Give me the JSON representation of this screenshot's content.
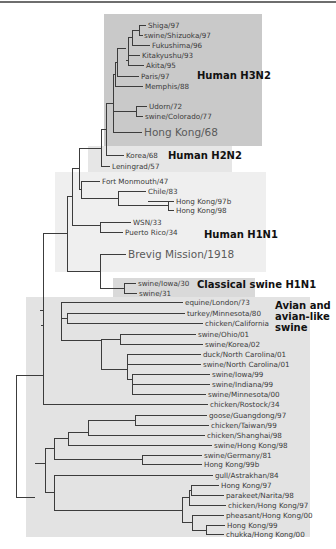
{
  "figure": {
    "type": "phylogenetic-tree",
    "colors": {
      "h3n2_box": "#c9c9c9",
      "h2n2_box": "#e6e6e6",
      "h1n1_box": "#efefef",
      "classical_swine_box": "#d9d9d9",
      "avian_box": "#e3e3e3",
      "line": "#3c3c3c"
    },
    "clades": [
      {
        "id": "h3n2",
        "label": "Human H3N2",
        "box": [
          104,
          14,
          158,
          132
        ],
        "fill": "#c9c9c9",
        "lines": [
          "Human H3N2"
        ],
        "label_xy": [
          197,
          79
        ]
      },
      {
        "id": "h2n2",
        "label": "Human H2N2",
        "box": [
          88,
          146,
          144,
          26
        ],
        "fill": "#e6e6e6",
        "lines": [
          "Human H2N2"
        ],
        "label_xy": [
          168,
          159
        ]
      },
      {
        "id": "h1n1",
        "label": "Human H1N1",
        "box": [
          55,
          172,
          211,
          100
        ],
        "fill": "#efefef",
        "lines": [
          "Human H1N1"
        ],
        "label_xy": [
          204,
          238
        ]
      },
      {
        "id": "classical",
        "label": "Classical swine H1N1",
        "box": [
          113,
          278,
          142,
          19
        ],
        "fill": "#d9d9d9",
        "lines": [
          "Classical swine H1N1"
        ],
        "label_xy": [
          197,
          288
        ]
      },
      {
        "id": "avian",
        "label": "Avian and avian-like swine",
        "box": [
          26,
          297,
          284,
          240
        ],
        "fill": "#e3e3e3",
        "lines": [
          "Avian and",
          "avian-like",
          "swine"
        ],
        "label_xy": [
          275,
          309
        ]
      }
    ],
    "leaves": [
      {
        "name": "Shiga/97",
        "x": 148,
        "y": 25
      },
      {
        "name": "swine/Shizuoka/97",
        "x": 144,
        "y": 35
      },
      {
        "name": "Fukushima/96",
        "x": 152,
        "y": 45
      },
      {
        "name": "Kitakyushu/93",
        "x": 142,
        "y": 55
      },
      {
        "name": "Akita/95",
        "x": 146,
        "y": 65
      },
      {
        "name": "Paris/97",
        "x": 141,
        "y": 76
      },
      {
        "name": "Memphis/88",
        "x": 145,
        "y": 86
      },
      {
        "name": "Udorn/72",
        "x": 149,
        "y": 106
      },
      {
        "name": "swine/Colorado/77",
        "x": 145,
        "y": 116
      },
      {
        "name": "Hong Kong/68",
        "x": 144,
        "y": 132,
        "big": true
      },
      {
        "name": "Korea/68",
        "x": 126,
        "y": 155
      },
      {
        "name": "Leningrad/57",
        "x": 112,
        "y": 166
      },
      {
        "name": "Fort Monmouth/47",
        "x": 102,
        "y": 181
      },
      {
        "name": "Chile/83",
        "x": 148,
        "y": 191
      },
      {
        "name": "Hong Kong/97b",
        "x": 176,
        "y": 201
      },
      {
        "name": "Hong Kong/98",
        "x": 176,
        "y": 210
      },
      {
        "name": "WSN/33",
        "x": 133,
        "y": 222
      },
      {
        "name": "Puerto Rico/34",
        "x": 125,
        "y": 232
      },
      {
        "name": "Brevig Mission/1918",
        "x": 128,
        "y": 254,
        "big": true
      },
      {
        "name": "swine/Iowa/30",
        "x": 138,
        "y": 283
      },
      {
        "name": "swine/31",
        "x": 139,
        "y": 293
      },
      {
        "name": "equine/London/73",
        "x": 185,
        "y": 302
      },
      {
        "name": "turkey/Minnesota/80",
        "x": 187,
        "y": 313
      },
      {
        "name": "chicken/California",
        "x": 205,
        "y": 323
      },
      {
        "name": "swine/Ohio/01",
        "x": 198,
        "y": 334
      },
      {
        "name": "swine/Korea/02",
        "x": 205,
        "y": 344
      },
      {
        "name": "duck/North Carolina/01",
        "x": 203,
        "y": 354
      },
      {
        "name": "swine/North Carolina/01",
        "x": 203,
        "y": 364
      },
      {
        "name": "swine/Iowa/99",
        "x": 212,
        "y": 374
      },
      {
        "name": "swine/Indiana/99",
        "x": 212,
        "y": 384
      },
      {
        "name": "swine/Minnesota/00",
        "x": 208,
        "y": 394
      },
      {
        "name": "chicken/Rostock/34",
        "x": 210,
        "y": 404
      },
      {
        "name": "goose/Guangdong/97",
        "x": 209,
        "y": 415
      },
      {
        "name": "chicken/Taiwan/99",
        "x": 211,
        "y": 425
      },
      {
        "name": "chicken/Shanghai/98",
        "x": 207,
        "y": 435
      },
      {
        "name": "swine/Hong Kong/98",
        "x": 214,
        "y": 445
      },
      {
        "name": "swine/Germany/81",
        "x": 204,
        "y": 455
      },
      {
        "name": "Hong Kong/99b",
        "x": 204,
        "y": 464
      },
      {
        "name": "gull/Astrakhan/84",
        "x": 215,
        "y": 475
      },
      {
        "name": "Hong Kong/97",
        "x": 221,
        "y": 485
      },
      {
        "name": "parakeet/Narita/98",
        "x": 226,
        "y": 495
      },
      {
        "name": "chicken/Hong Kong/97",
        "x": 228,
        "y": 505
      },
      {
        "name": "pheasant/Hong Kong/00",
        "x": 226,
        "y": 515
      },
      {
        "name": "Hong Kong/99",
        "x": 227,
        "y": 525
      },
      {
        "name": "chukka/Hong Kong/00",
        "x": 226,
        "y": 534
      }
    ],
    "edges": [
      "M146 25 H139 V35 H143",
      "M139 30 H132 V45 H150",
      "M132 37 H128 V59 H128",
      "M128 55 H140 M128 55 V65 H144 M128 60 H126",
      "M126 48 H117 V76 H139",
      "M117 62 H115 V86 H143",
      "M136 106 H147 M136 106 V116 H143 M136 111 H113",
      "M115 74 H113 V132 H142",
      "M113 103 H106 V155 H124",
      "M106 129 H101 V166 H110",
      "M148 201 H174 M168 201 V210 H174",
      "M118 191 H146 M118 191 V205 H168",
      "M81 181 H100 M81 181 V198 H118",
      "M101 148 H79 V189 H81",
      "M100 222 H131 M100 222 V232 H123",
      "M79 168 H72 V225 H100",
      "M124 283 H136 M124 283 V293 H137",
      "M100 254 H126 M100 254 V288 H124",
      "M72 196 H67 V271 H100",
      "M67 233 H43 V325",
      "M61 302 H183 M61 302 V320",
      "M67 313 H185 M67 313 V323 H203",
      "M120 334 H196 M120 334 V344 H203",
      "M127 354 H201 M127 354 V364 H201",
      "M132 374 H210 M132 374 V394 H206 M132 384 H210",
      "M127 359 V379 H132",
      "M120 339 H101 V369 H127",
      "M61 318 H67 M61 318 H61",
      "M61 340 H101",
      "M61 302 V340",
      "M43 325 H41 M43 302 V325",
      "M40 310 H43 V404 H208",
      "M16 375 H43 M16 375 V497 H35",
      "M135 415 H207 M135 415 V425 H209",
      "M88 420 H135 M88 420 V435 H205",
      "M68 432 H88 M68 432 V445 H212",
      "M142 455 H202 M142 455 V464 H202",
      "M54 438 H68 M54 438 V459 H142",
      "M191 485 H219 M191 485 V495 H224 M191 490 H189 V505 H226",
      "M206 525 H225 M206 525 V534 H224",
      "M192 515 H224 M192 515 V530 H206",
      "M182 497 H189 M182 497 V522 H192",
      "M54 475 H213 M54 475 V510 H182",
      "M45 448 H54 M45 448 V492 H54",
      "M35 463 H45"
    ]
  }
}
